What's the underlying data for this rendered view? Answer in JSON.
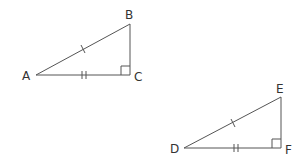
{
  "diagram": {
    "triangles": [
      {
        "name": "ABC",
        "vertices": {
          "A": [
            36,
            75
          ],
          "B": [
            130,
            24
          ],
          "C": [
            130,
            75
          ]
        },
        "labels": {
          "A": "A",
          "B": "B",
          "C": "C"
        },
        "right_angle_at": "C",
        "marks": {
          "AB": "single-tick",
          "AC": "double-tick"
        }
      },
      {
        "name": "DEF",
        "vertices": {
          "D": [
            184,
            148
          ],
          "E": [
            281,
            97
          ],
          "F": [
            281,
            148
          ]
        },
        "labels": {
          "D": "D",
          "E": "E",
          "F": "F"
        },
        "right_angle_at": "F",
        "marks": {
          "DE": "single-tick",
          "DF": "double-tick"
        }
      }
    ],
    "colors": {
      "line": "#555555",
      "text": "#333333"
    }
  }
}
